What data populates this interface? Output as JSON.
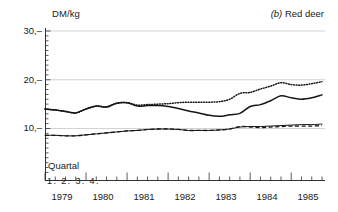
{
  "panel": {
    "tag": "(b)",
    "name": "Red deer",
    "y_axis_label": "DM/kg",
    "x_axis_label": "Quartal",
    "quarter_ticks": "1. 2. 3. 4."
  },
  "axis": {
    "y_ticks": [
      "30,–",
      "20,–",
      "10,–"
    ],
    "y_tick_values": [
      30,
      20,
      10
    ],
    "x_years": [
      "1979",
      "1980",
      "1981",
      "1982",
      "1983",
      "1984",
      "1985"
    ]
  },
  "chart_data": {
    "type": "line",
    "title": "(b) Red deer",
    "xlabel": "Quartal",
    "ylabel": "DM/kg",
    "ylim": [
      0,
      30
    ],
    "xlim": [
      1979.0,
      1985.75
    ],
    "grid": true,
    "legend": "none",
    "y_tick_labels": [
      "10,–",
      "20,–",
      "30,–"
    ],
    "x_tick_labels": [
      "1979",
      "1980",
      "1981",
      "1982",
      "1983",
      "1984",
      "1985"
    ],
    "x_minor_ticks": "quarterly",
    "x": [
      1979.0,
      1979.25,
      1979.5,
      1979.75,
      1980.0,
      1980.25,
      1980.5,
      1980.75,
      1981.0,
      1981.25,
      1981.5,
      1981.75,
      1982.0,
      1982.25,
      1982.5,
      1982.75,
      1983.0,
      1983.25,
      1983.5,
      1983.75,
      1984.0,
      1984.25,
      1984.5,
      1984.75,
      1985.0,
      1985.25,
      1985.5,
      1985.75
    ],
    "series": [
      {
        "name": "upper-dotted",
        "style": "dotted",
        "values": [
          14.0,
          13.8,
          13.5,
          13.2,
          14.0,
          14.6,
          14.4,
          15.2,
          15.3,
          14.8,
          14.9,
          15.0,
          15.1,
          15.3,
          15.4,
          15.4,
          15.4,
          15.5,
          16.0,
          17.2,
          17.4,
          18.1,
          18.7,
          19.4,
          19.0,
          18.9,
          19.2,
          19.6
        ]
      },
      {
        "name": "upper-solid",
        "style": "solid",
        "values": [
          14.0,
          13.8,
          13.5,
          13.2,
          14.0,
          14.6,
          14.4,
          15.2,
          15.3,
          14.6,
          14.7,
          14.7,
          14.5,
          14.1,
          13.6,
          13.2,
          12.7,
          12.5,
          12.8,
          13.1,
          14.5,
          14.9,
          15.7,
          16.7,
          16.3,
          16.0,
          16.3,
          16.9
        ]
      },
      {
        "name": "lower-solid",
        "style": "solid-thin",
        "values": [
          8.6,
          8.6,
          8.5,
          8.5,
          8.7,
          8.9,
          9.1,
          9.3,
          9.5,
          9.6,
          9.8,
          9.9,
          9.9,
          9.8,
          9.6,
          9.6,
          9.6,
          9.7,
          9.9,
          10.3,
          10.4,
          10.4,
          10.5,
          10.6,
          10.7,
          10.8,
          10.8,
          10.9
        ]
      },
      {
        "name": "lower-dashed",
        "style": "dashed",
        "values": [
          8.6,
          8.6,
          8.5,
          8.5,
          8.7,
          8.9,
          9.1,
          9.3,
          9.5,
          9.6,
          9.8,
          9.9,
          9.9,
          9.8,
          9.6,
          9.6,
          9.6,
          9.7,
          9.9,
          10.4,
          10.3,
          10.2,
          10.3,
          10.4,
          10.5,
          10.5,
          10.5,
          10.6
        ]
      }
    ]
  },
  "colors": {
    "line": "#161616",
    "grid": "#c8c8c8",
    "axis": "#333333"
  }
}
